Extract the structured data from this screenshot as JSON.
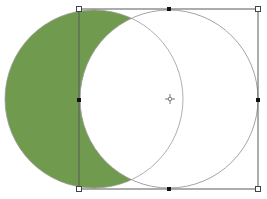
{
  "canvas": {
    "width": 267,
    "height": 199,
    "background": "#ffffff"
  },
  "shapes": {
    "left_circle": {
      "cx": 94,
      "cy": 99,
      "r": 89,
      "fill": "#709a4e",
      "stroke": "#999999"
    },
    "right_circle": {
      "cx": 169,
      "cy": 99,
      "r": 89,
      "fill": "none",
      "stroke": "#999999"
    },
    "crescent_fill": "#709a4e"
  },
  "selection": {
    "bounding_box": {
      "x": 79,
      "y": 9,
      "width": 179,
      "height": 180,
      "stroke": "#555555"
    },
    "corner_handles": [
      {
        "name": "top-left",
        "x": 79,
        "y": 9
      },
      {
        "name": "top-right",
        "x": 258,
        "y": 9
      },
      {
        "name": "bottom-left",
        "x": 79,
        "y": 189
      },
      {
        "name": "bottom-right",
        "x": 258,
        "y": 189
      }
    ],
    "mid_handles": [
      {
        "name": "top",
        "x": 169,
        "y": 9
      },
      {
        "name": "bottom",
        "x": 169,
        "y": 189
      },
      {
        "name": "left",
        "x": 79,
        "y": 100
      },
      {
        "name": "right",
        "x": 258,
        "y": 100
      }
    ],
    "center_point": {
      "x": 170,
      "y": 99
    }
  }
}
